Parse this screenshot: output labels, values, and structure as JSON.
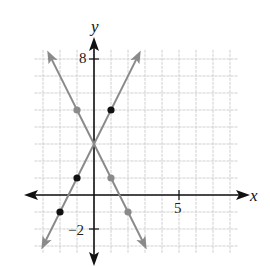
{
  "chart_data": {
    "type": "line",
    "title": "",
    "xlabel": "x",
    "ylabel": "y",
    "xlim": [
      -3.5,
      8.5
    ],
    "ylim": [
      -3.4,
      8.6
    ],
    "grid": true,
    "grid_step": 1,
    "tick_labels": [
      {
        "axis": "y",
        "value": 8,
        "label": "8"
      },
      {
        "axis": "y",
        "value": -2,
        "label": "−2"
      },
      {
        "axis": "x",
        "value": 5,
        "label": "5"
      }
    ],
    "series": [
      {
        "name": "y = 2x + 3",
        "equation": "y = 2x + 3",
        "slope": 2,
        "intercept": 3,
        "line_color": "#8a8a8a",
        "point_color": "#111111",
        "points": [
          [
            -2,
            -1
          ],
          [
            -1,
            1
          ],
          [
            1,
            5
          ]
        ],
        "x_range": [
          -3.1,
          2.75
        ]
      },
      {
        "name": "y = -2x + 3",
        "equation": "y = -2x + 3",
        "slope": -2,
        "intercept": 3,
        "line_color": "#8a8a8a",
        "point_color": "#8a8a8a",
        "points": [
          [
            -1,
            5
          ],
          [
            1,
            1
          ],
          [
            2,
            -1
          ]
        ],
        "x_range": [
          -2.75,
          3.1
        ]
      }
    ],
    "intersection": [
      0,
      3
    ]
  },
  "labels": {
    "x_axis": "x",
    "y_axis": "y",
    "tick_8": "8",
    "tick_neg2": "−2",
    "tick_5": "5"
  },
  "colors": {
    "grid": "#cfcfcf",
    "axis": "#111111",
    "line": "#8a8a8a",
    "point_black": "#111111",
    "point_gray": "#8a8a8a"
  }
}
